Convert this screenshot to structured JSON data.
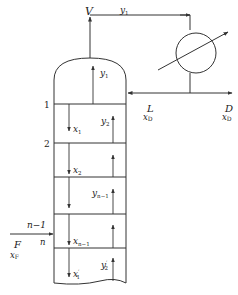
{
  "diagram": {
    "type": "distillation-column-schematic",
    "colors": {
      "stroke": "#333333",
      "text": "#222222",
      "background": "#ffffff"
    },
    "overhead": {
      "vapor_label": "V",
      "vapor_stream_label": "y",
      "vapor_stream_sub": "1"
    },
    "condenser": {
      "name": "condenser"
    },
    "reflux": {
      "label": "L",
      "composition": "x",
      "composition_sub": "D"
    },
    "distillate": {
      "label": "D",
      "composition": "x",
      "composition_sub": "D"
    },
    "plate_numbers": {
      "p1": "1",
      "p2": "2",
      "pn_minus_1": "n−1",
      "pn": "n"
    },
    "feed": {
      "label": "F",
      "composition": "x",
      "composition_sub": "F"
    },
    "streams": {
      "y1": {
        "var": "y",
        "sub": "1"
      },
      "x1": {
        "var": "x",
        "sub": "1"
      },
      "y2": {
        "var": "y",
        "sub": "2"
      },
      "x2": {
        "var": "x",
        "sub": "2"
      },
      "yn_1": {
        "var": "y",
        "sub": "n−1"
      },
      "xn_1": {
        "var": "x",
        "sub": "n−1"
      },
      "x1p": {
        "var": "x",
        "sub": "1",
        "prime": "′"
      },
      "y2p": {
        "var": "y",
        "sub": "2",
        "prime": "′"
      }
    }
  }
}
